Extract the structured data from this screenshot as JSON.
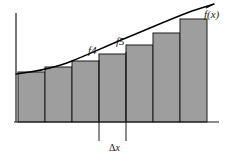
{
  "figure": {
    "labels": {
      "curve": "f(x)",
      "bar4": "f4",
      "bar5": "f5",
      "delta_x_symbol": "Δ",
      "delta_x_var": "x",
      "delta_x": "Δx"
    },
    "colors": {
      "bar_fill": "#9e9e9e",
      "bar_stroke": "#1a1a1a",
      "curve": "#000000",
      "axis": "#1a1a1a",
      "background": "#ffffff",
      "text": "#1a1a1a"
    }
  },
  "chart_data": {
    "type": "bar",
    "title": "",
    "xlabel": "Δx",
    "ylabel": "",
    "grid": false,
    "legend": null,
    "categories": [
      "f1",
      "f2",
      "f3",
      "f4",
      "f5",
      "f6",
      "f7"
    ],
    "labeled_categories": [
      "f4",
      "f5"
    ],
    "bar_count": 7,
    "bar_width_px": 27,
    "baseline_y_px": 122,
    "axis_origin_px": [
      16,
      122
    ],
    "bar_left_edges_px": [
      18,
      45,
      72,
      99,
      126,
      153,
      180
    ],
    "bar_top_y_px": [
      72,
      67,
      61,
      54,
      45,
      33,
      19
    ],
    "values": [
      50,
      55,
      61,
      68,
      77,
      89,
      103
    ],
    "ylim": [
      0,
      110
    ],
    "series": [
      {
        "name": "Rectangle heights (left-endpoint Riemann sum)",
        "values": [
          50,
          55,
          61,
          68,
          77,
          89,
          103
        ]
      },
      {
        "name": "f(x) curve sample points",
        "x": [
          16,
          45,
          72,
          99,
          126,
          153,
          180,
          207,
          218
        ],
        "values": [
          48,
          55,
          61,
          68,
          77,
          89,
          103,
          120,
          128
        ]
      }
    ],
    "annotations": [
      {
        "text": "f(x)",
        "x_px": 204,
        "y_px": 9,
        "target": "curve-end"
      },
      {
        "text": "f4",
        "x_px": 88,
        "y_px": 45,
        "target": "bar-4-top"
      },
      {
        "text": "f5",
        "x_px": 116,
        "y_px": 36,
        "target": "bar-5-top"
      },
      {
        "text": "Δx",
        "x_px": 109,
        "y_px": 143,
        "target": "bar-5-width"
      }
    ],
    "pointer_lines_px": [
      {
        "name": "f4-pointer",
        "x": 99,
        "y1": 60,
        "y2": 141
      },
      {
        "name": "f5-pointer",
        "x": 126,
        "y1": 52,
        "y2": 141
      }
    ]
  }
}
